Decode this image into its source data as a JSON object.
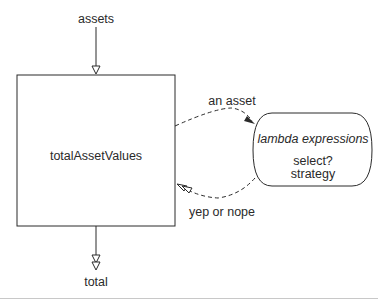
{
  "diagram": {
    "input_label": "assets",
    "output_label": "total",
    "main_box": {
      "label": "totalAssetValues"
    },
    "lambda_box": {
      "title": "lambda expressions",
      "line1": "select?",
      "line2": "strategy"
    },
    "edges": {
      "to_lambda": "an asset",
      "from_lambda": "yep or nope"
    }
  },
  "colors": {
    "stroke": "#2a2a2a",
    "background": "#ffffff",
    "caption_rule": "#c8c8c8"
  },
  "caption": {
    "text": ""
  }
}
